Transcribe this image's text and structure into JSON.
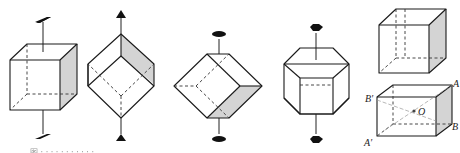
{
  "figure": {
    "panels": [
      {
        "id": "cube-4fold",
        "axis_symbol": "parallelogram (4-fold axis)"
      },
      {
        "id": "cube-3fold",
        "axis_symbol": "triangle (3-fold axis)"
      },
      {
        "id": "cube-2fold",
        "axis_symbol": "ellipse (2-fold axis)"
      },
      {
        "id": "cube-hexagonal-view",
        "axis_symbol": "hexagon (6-fold / 3-bar axis)"
      },
      {
        "id": "cube-center-inversion",
        "axis_symbol": "none"
      }
    ],
    "labels": {
      "A": "A",
      "B": "B",
      "A_prime": "A′",
      "B_prime": "B′",
      "O": "O"
    },
    "caption": "图 · · · · · · · · · · ·"
  },
  "colors": {
    "line": "#1a1a1a",
    "shade": "#d4d4d4",
    "background": "#ffffff"
  }
}
